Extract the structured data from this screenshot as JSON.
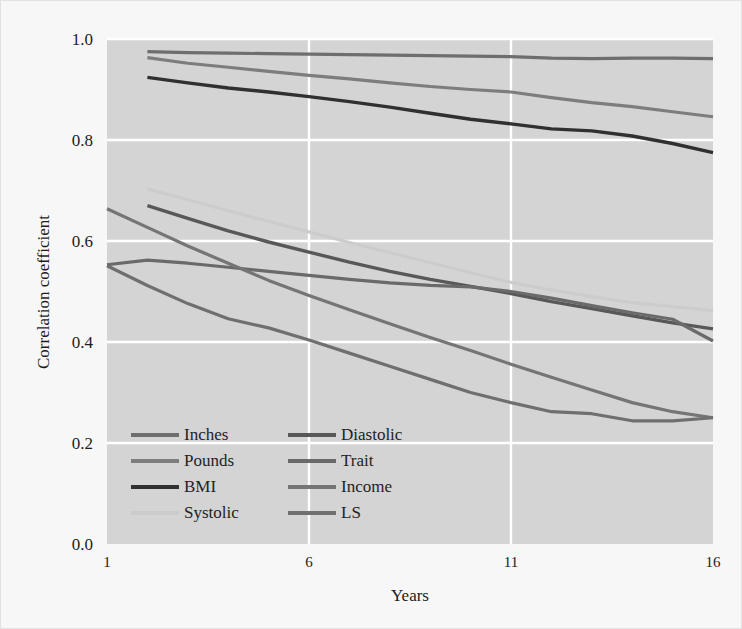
{
  "chart_data": {
    "type": "line",
    "title": "",
    "xlabel": "Years",
    "ylabel": "Correlation coefficient",
    "xlim": [
      1,
      16
    ],
    "ylim": [
      0.0,
      1.0
    ],
    "xticks": [
      1,
      6,
      11,
      16
    ],
    "xtick_labels": [
      "1",
      "6",
      "11",
      "16"
    ],
    "yticks": [
      0.0,
      0.2,
      0.4,
      0.6,
      0.8,
      1.0
    ],
    "ytick_labels": [
      "0.0",
      "0.2",
      "0.4",
      "0.6",
      "0.8",
      "1.0"
    ],
    "grid": true,
    "grid_color": "#ffffff",
    "plot_background": "#d4d4d4",
    "figure_background": "#f7f7f7",
    "legend_position": "lower left",
    "legend_columns": 2,
    "series": [
      {
        "name": "Inches",
        "color": "#6e6e6e",
        "width": 3.2,
        "x": [
          2,
          3,
          4,
          5,
          6,
          7,
          8,
          9,
          10,
          11,
          12,
          13,
          14,
          15,
          16
        ],
        "values": [
          0.975,
          0.973,
          0.972,
          0.971,
          0.97,
          0.969,
          0.968,
          0.967,
          0.966,
          0.965,
          0.962,
          0.961,
          0.962,
          0.962,
          0.961
        ]
      },
      {
        "name": "Pounds",
        "color": "#7d7d7d",
        "width": 3.2,
        "x": [
          2,
          3,
          4,
          5,
          6,
          7,
          8,
          9,
          10,
          11,
          12,
          13,
          14,
          15,
          16
        ],
        "values": [
          0.963,
          0.952,
          0.944,
          0.936,
          0.928,
          0.921,
          0.913,
          0.906,
          0.9,
          0.895,
          0.884,
          0.874,
          0.866,
          0.856,
          0.846
        ]
      },
      {
        "name": "BMI",
        "color": "#303030",
        "width": 3.4,
        "x": [
          2,
          3,
          4,
          5,
          6,
          7,
          8,
          9,
          10,
          11,
          12,
          13,
          14,
          15,
          16
        ],
        "values": [
          0.924,
          0.913,
          0.903,
          0.895,
          0.886,
          0.876,
          0.865,
          0.853,
          0.841,
          0.832,
          0.822,
          0.818,
          0.808,
          0.793,
          0.775
        ]
      },
      {
        "name": "Systolic",
        "color": "#cccccc",
        "width": 3.2,
        "x": [
          2,
          3,
          4,
          5,
          6,
          7,
          8,
          9,
          10,
          11,
          12,
          13,
          14,
          15,
          16
        ],
        "values": [
          0.703,
          0.682,
          0.66,
          0.639,
          0.618,
          0.597,
          0.577,
          0.557,
          0.537,
          0.518,
          0.503,
          0.49,
          0.478,
          0.47,
          0.462
        ]
      },
      {
        "name": "Diastolic",
        "color": "#585858",
        "width": 3.4,
        "x": [
          2,
          3,
          4,
          5,
          6,
          7,
          8,
          9,
          10,
          11,
          12,
          13,
          14,
          15,
          16
        ],
        "values": [
          0.67,
          0.645,
          0.62,
          0.598,
          0.578,
          0.558,
          0.54,
          0.524,
          0.51,
          0.496,
          0.48,
          0.466,
          0.452,
          0.438,
          0.426
        ]
      },
      {
        "name": "Trait",
        "color": "#6a6a6a",
        "width": 3.2,
        "x": [
          1,
          2,
          3,
          4,
          5,
          6,
          7,
          8,
          9,
          10,
          11,
          12,
          13,
          14,
          15,
          16
        ],
        "values": [
          0.553,
          0.562,
          0.556,
          0.548,
          0.54,
          0.532,
          0.524,
          0.517,
          0.512,
          0.509,
          0.5,
          0.487,
          0.472,
          0.458,
          0.445,
          0.402
        ]
      },
      {
        "name": "Income",
        "color": "#757575",
        "width": 3.2,
        "x": [
          1,
          2,
          3,
          4,
          5,
          6,
          7,
          8,
          9,
          10,
          11,
          12,
          13,
          14,
          15,
          16
        ],
        "values": [
          0.664,
          0.627,
          0.59,
          0.556,
          0.522,
          0.492,
          0.464,
          0.436,
          0.409,
          0.383,
          0.356,
          0.33,
          0.305,
          0.28,
          0.262,
          0.25
        ]
      },
      {
        "name": "LS",
        "color": "#6f6f6f",
        "width": 3.2,
        "x": [
          1,
          2,
          3,
          4,
          5,
          6,
          7,
          8,
          9,
          10,
          11,
          12,
          13,
          14,
          15,
          16
        ],
        "values": [
          0.551,
          0.512,
          0.476,
          0.446,
          0.428,
          0.404,
          0.378,
          0.352,
          0.326,
          0.3,
          0.28,
          0.262,
          0.258,
          0.244,
          0.244,
          0.25
        ]
      }
    ],
    "legend_order": [
      "Inches",
      "Diastolic",
      "Pounds",
      "Trait",
      "BMI",
      "Income",
      "Systolic",
      "LS"
    ]
  },
  "plot_geometry": {
    "left": 106,
    "right": 712,
    "top": 38,
    "bottom": 543
  },
  "legend_geometry": {
    "col1_swatch_x": 130,
    "col1_text_x": 183,
    "col2_swatch_x": 287,
    "col2_text_x": 340,
    "row_start_y": 434,
    "row_step": 26,
    "swatch_width": 48
  }
}
